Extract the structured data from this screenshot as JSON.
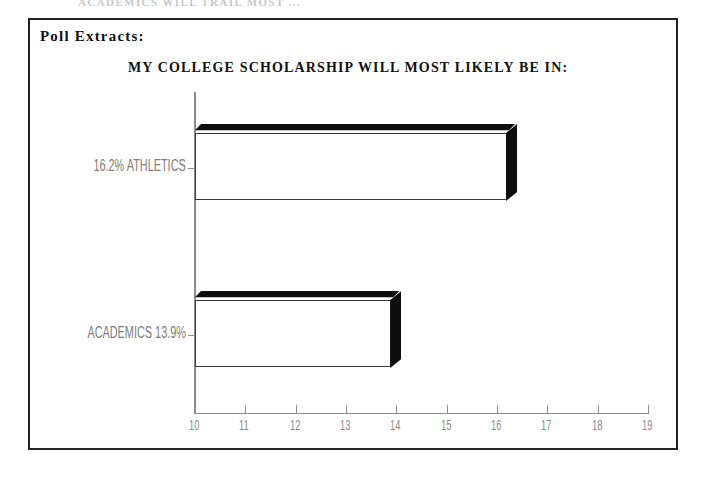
{
  "page": {
    "ghost_text_above_frame": "ACADEMICS WILL TRAIL MOST ..."
  },
  "panel": {
    "header": "Poll Extracts:"
  },
  "chart_data": {
    "type": "bar",
    "orientation": "horizontal",
    "title": "MY COLLEGE SCHOLARSHIP WILL MOST LIKELY BE IN:",
    "xlabel": "",
    "ylabel": "",
    "xlim": [
      10,
      19
    ],
    "grid": false,
    "legend": null,
    "categories": [
      "16.2% ATHLETICS",
      "ACADEMICS 13.9%"
    ],
    "values": [
      16.2,
      13.9
    ],
    "bars": [
      {
        "label": "16.2% ATHLETICS",
        "category": "ATHLETICS",
        "value": 16.2,
        "value_label": "16.2%"
      },
      {
        "label": "ACADEMICS 13.9%",
        "category": "ACADEMICS",
        "value": 13.9,
        "value_label": "13.9%"
      }
    ],
    "xticks": [
      {
        "label": "10",
        "value": 10
      },
      {
        "label": "11",
        "value": 11
      },
      {
        "label": "12",
        "value": 12
      },
      {
        "label": "13",
        "value": 13
      },
      {
        "label": "14",
        "value": 14
      },
      {
        "label": "15",
        "value": 15
      },
      {
        "label": "16",
        "value": 16
      },
      {
        "label": "17",
        "value": 17
      },
      {
        "label": "18",
        "value": 18
      },
      {
        "label": "19",
        "value": 19
      }
    ],
    "colors": {
      "bar_fill": "#c9c9c9",
      "bar_edge": "#3a3a3a",
      "bar_shadow": "#0d0d0d",
      "axis": "#8c8c8c",
      "tick_label": "#8a8a8a",
      "category_label": "#7d7d7d",
      "title": "#111111",
      "frame": "#222222",
      "background": "#ffffff"
    }
  }
}
